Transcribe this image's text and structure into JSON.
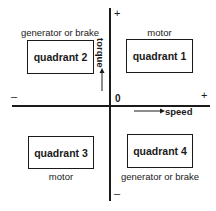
{
  "diagram": {
    "axes": {
      "vertical": {
        "label": "torque",
        "positive": "+",
        "negative": "–"
      },
      "horizontal": {
        "label": "speed",
        "positive": "+",
        "negative": "–"
      },
      "origin": "0"
    },
    "quadrants": [
      {
        "id": 1,
        "label": "quadrant 1",
        "mode": "motor"
      },
      {
        "id": 2,
        "label": "quadrant 2",
        "mode": "generator or brake"
      },
      {
        "id": 3,
        "label": "quadrant 3",
        "mode": "motor"
      },
      {
        "id": 4,
        "label": "quadrant 4",
        "mode": "generator or brake"
      }
    ]
  }
}
